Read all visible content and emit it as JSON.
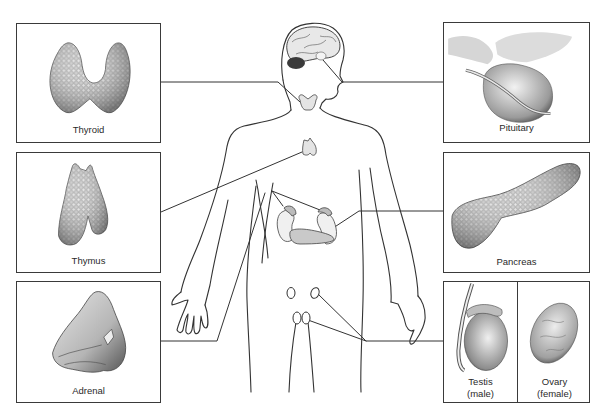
{
  "diagram": {
    "type": "anatomical-illustration",
    "colors": {
      "line": "#333333",
      "gland_fill": "#d9d9d9",
      "gland_shade": "#8a8a8a",
      "background": "#ffffff"
    }
  },
  "panels": {
    "thyroid": {
      "label": "Thyroid"
    },
    "thymus": {
      "label": "Thymus"
    },
    "adrenal": {
      "label": "Adrenal"
    },
    "pituitary": {
      "label": "Pituitary"
    },
    "pancreas": {
      "label": "Pancreas"
    },
    "testis": {
      "label_line1": "Testis",
      "label_line2": "(male)"
    },
    "ovary": {
      "label_line1": "Ovary",
      "label_line2": "(female)"
    }
  }
}
